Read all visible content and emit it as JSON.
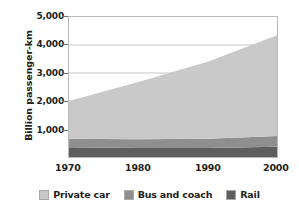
{
  "chart_data": {
    "type": "area",
    "stacked": true,
    "title": "",
    "subtitle": "",
    "xlabel": "",
    "ylabel": "Billion passenger-km",
    "x": [
      1970,
      1980,
      1990,
      2000
    ],
    "xlim": [
      1970,
      2000
    ],
    "ylim": [
      0,
      5000
    ],
    "xticks": [
      "1970",
      "1980",
      "1990",
      "2000"
    ],
    "yticks": [
      "1,000",
      "2,000",
      "3,000",
      "4,000",
      "5,000"
    ],
    "ytick_values": [
      1000,
      2000,
      3000,
      4000,
      5000
    ],
    "grid": "horizontal",
    "legend_position": "bottom",
    "series": [
      {
        "name": "Private car",
        "color": "#c9c9c9",
        "values": [
          1350,
          2050,
          2750,
          3600
        ]
      },
      {
        "name": "Bus and coach",
        "color": "#8f8f8f",
        "values": [
          300,
          310,
          330,
          380
        ]
      },
      {
        "name": "Rail",
        "color": "#5e5e5e",
        "values": [
          350,
          320,
          320,
          370
        ]
      }
    ],
    "stack_totals": [
      2000,
      2680,
      3400,
      4350
    ],
    "annotations": []
  },
  "axes": {
    "y_title": "Billion passenger-km",
    "y_ticks": [
      {
        "label": "5,000",
        "value": 5000
      },
      {
        "label": "4,000",
        "value": 4000
      },
      {
        "label": "3,000",
        "value": 3000
      },
      {
        "label": "2,000",
        "value": 2000
      },
      {
        "label": "1,000",
        "value": 1000
      }
    ],
    "x_ticks": [
      {
        "label": "1970",
        "value": 1970
      },
      {
        "label": "1980",
        "value": 1980
      },
      {
        "label": "1990",
        "value": 1990
      },
      {
        "label": "2000",
        "value": 2000
      }
    ]
  },
  "legend": {
    "items": [
      {
        "label": "Private car",
        "color": "#c9c9c9"
      },
      {
        "label": "Bus and coach",
        "color": "#8f8f8f"
      },
      {
        "label": "Rail",
        "color": "#5e5e5e"
      }
    ]
  },
  "colors": {
    "private_car": "#c9c9c9",
    "bus_and_coach": "#8f8f8f",
    "rail": "#5e5e5e",
    "gridline": "#b9b9b9",
    "axis": "#6f6f6f",
    "text": "#231f20",
    "background": "#ffffff"
  }
}
